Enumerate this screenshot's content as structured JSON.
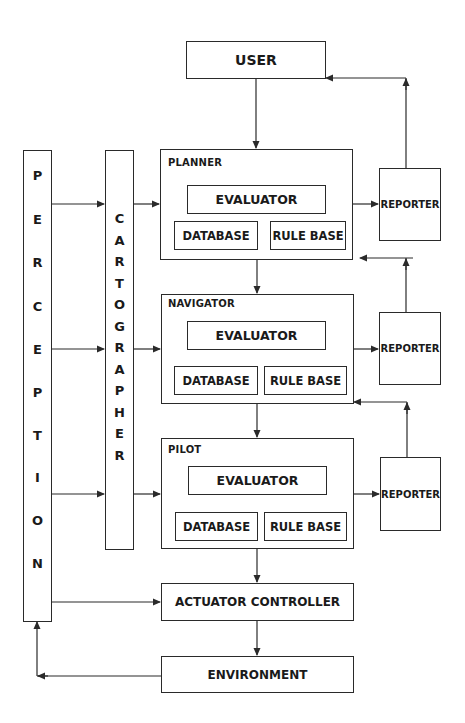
{
  "diagram": {
    "user": {
      "label": "USER"
    },
    "perception": {
      "label": "PERCEPTION",
      "letters": [
        "P",
        "E",
        "R",
        "C",
        "E",
        "P",
        "T",
        "I",
        "O",
        "N"
      ]
    },
    "cartographer": {
      "label": "CARTOGRAPHER",
      "letters": [
        "C",
        "A",
        "R",
        "T",
        "O",
        "G",
        "R",
        "A",
        "P",
        "H",
        "E",
        "R"
      ]
    },
    "levels": [
      {
        "title": "PLANNER",
        "evaluator": "EVALUATOR",
        "database": "DATABASE",
        "rule_base": "RULE BASE",
        "reporter": "REPORTER"
      },
      {
        "title": "NAVIGATOR",
        "evaluator": "EVALUATOR",
        "database": "DATABASE",
        "rule_base": "RULE BASE",
        "reporter": "REPORTER"
      },
      {
        "title": "PILOT",
        "evaluator": "EVALUATOR",
        "database": "DATABASE",
        "rule_base": "RULE BASE",
        "reporter": "REPORTER"
      }
    ],
    "actuator_controller": {
      "label": "ACTUATOR CONTROLLER"
    },
    "environment": {
      "label": "ENVIRONMENT"
    },
    "colors": {
      "line": "#2a2a2a",
      "background": "#ffffff"
    }
  }
}
